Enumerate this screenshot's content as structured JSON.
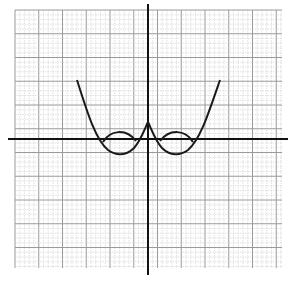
{
  "chart_data": {
    "type": "line",
    "title": "",
    "xlabel": "",
    "ylabel": "",
    "grid": true,
    "xlim": [
      -7,
      7
    ],
    "ylim": [
      -7,
      7
    ],
    "series": [
      {
        "name": "f(x) = (x^2-4)(x^2-1)/4 style W-curve (dips below axis)",
        "description": "Even quartic-like curve with two minima below the x-axis",
        "points": [
          [
            -3.5,
            3.5
          ],
          [
            -2.5,
            0.3
          ],
          [
            -2.3,
            0
          ],
          [
            -1.4,
            -0.8
          ],
          [
            -0.5,
            0
          ],
          [
            0,
            0.9
          ],
          [
            0.5,
            0
          ],
          [
            1.4,
            -0.8
          ],
          [
            2.3,
            0
          ],
          [
            2.5,
            0.3
          ],
          [
            3.5,
            3.5
          ]
        ]
      },
      {
        "name": "|f(x)| reflected portions",
        "description": "Portions below x-axis reflected above, forming small bumps",
        "points": [
          [
            -2.3,
            0
          ],
          [
            -1.4,
            0.8
          ],
          [
            -0.5,
            0
          ],
          [
            0.5,
            0
          ],
          [
            1.4,
            0.8
          ],
          [
            2.3,
            0
          ]
        ]
      }
    ]
  },
  "colors": {
    "curve": "#1a1a1a",
    "axis": "#111111",
    "grid_major": "#9a9a9a",
    "grid_minor": "#cfcfcf"
  }
}
